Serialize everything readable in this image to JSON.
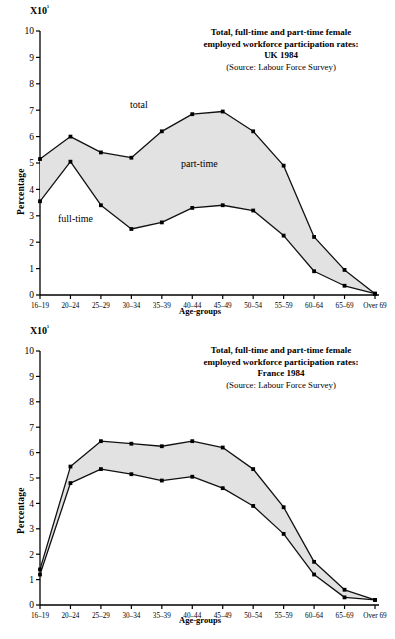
{
  "page": {
    "width": 395,
    "height": 639
  },
  "charts": [
    {
      "id": "uk-1984",
      "exponent_label": "X10",
      "exponent_sup": "¹",
      "title_line1": "Total, full-time and part-time female",
      "title_line2": "employed workforce participation rates:",
      "title_line3": "UK 1984",
      "title_source": "(Source: Labour Force Survey)",
      "ylabel": "Percentage",
      "xlabel": "Age-groups",
      "annotations": [
        {
          "text": "total",
          "x": 130,
          "y": 108
        },
        {
          "text": "part-time",
          "x": 181,
          "y": 167
        },
        {
          "text": "full-time",
          "x": 58,
          "y": 222
        }
      ],
      "yticks": [
        "10",
        "9",
        "8",
        "7",
        "6",
        "5",
        "4",
        "3",
        "2",
        "1",
        "0"
      ],
      "xticks": [
        "16–19",
        "20–24",
        "25–29",
        "30–34",
        "35–39",
        "40–44",
        "45–49",
        "50–54",
        "55–59",
        "60–64",
        "65–69",
        "Over 69"
      ],
      "chart_data": {
        "type": "area",
        "title": "Total, full-time and part-time female employed workforce participation rates: UK 1984",
        "subtitle": "(Source: Labour Force Survey)",
        "xlabel": "Age-groups",
        "ylabel": "Percentage",
        "y_multiplier": "X10¹",
        "ylim": [
          0,
          10
        ],
        "grid": false,
        "legend_position": "inline-annotations",
        "categories": [
          "16–19",
          "20–24",
          "25–29",
          "30–34",
          "35–39",
          "40–44",
          "45–49",
          "50–54",
          "55–59",
          "60–64",
          "65–69",
          "Over 69"
        ],
        "series": [
          {
            "name": "total",
            "values": [
              5.15,
              6.0,
              5.4,
              5.2,
              6.2,
              6.85,
              6.95,
              6.2,
              4.9,
              2.2,
              0.95,
              0.05
            ]
          },
          {
            "name": "full-time",
            "values": [
              3.55,
              5.05,
              3.4,
              2.5,
              2.75,
              3.3,
              3.4,
              3.2,
              2.25,
              0.9,
              0.35,
              0.05
            ]
          }
        ],
        "shaded_band": {
          "name": "part-time",
          "between": [
            "full-time",
            "total"
          ]
        }
      }
    },
    {
      "id": "france-1984",
      "exponent_label": "X10",
      "exponent_sup": "¹",
      "title_line1": "Total, full-time and part-time female",
      "title_line2": "employed workforce participation rates:",
      "title_line3": "France 1984",
      "title_source": "(Source: Labour Force Survey)",
      "ylabel": "Percentage",
      "xlabel": "Age-groups",
      "annotations": [
        {
          "text": "total",
          "x": 232,
          "y": 425
        },
        {
          "text": "part-time",
          "x": 163,
          "y": 452
        },
        {
          "text": "full-time",
          "x": 152,
          "y": 496
        }
      ],
      "yticks": [
        "10",
        "9",
        "8",
        "7",
        "6",
        "5",
        "4",
        "3",
        "2",
        "1",
        "0"
      ],
      "xticks": [
        "16–19",
        "20–24",
        "25–29",
        "30–34",
        "35–39",
        "40–44",
        "45–49",
        "50–54",
        "55–59",
        "60–64",
        "65–69",
        "Over 69"
      ],
      "chart_data": {
        "type": "area",
        "title": "Total, full-time and part-time female employed workforce participation rates: France 1984",
        "subtitle": "(Source: Labour Force Survey)",
        "xlabel": "Age-groups",
        "ylabel": "Percentage",
        "y_multiplier": "X10¹",
        "ylim": [
          0,
          10
        ],
        "grid": false,
        "legend_position": "inline-annotations",
        "categories": [
          "16–19",
          "20–24",
          "25–29",
          "30–34",
          "35–39",
          "40–44",
          "45–49",
          "50–54",
          "55–59",
          "60–64",
          "65–69",
          "Over 69"
        ],
        "series": [
          {
            "name": "total",
            "values": [
              1.4,
              5.45,
              6.45,
              6.35,
              6.25,
              6.45,
              6.2,
              5.35,
              3.85,
              1.7,
              0.6,
              0.2
            ]
          },
          {
            "name": "full-time",
            "values": [
              1.2,
              4.8,
              5.35,
              5.15,
              4.9,
              5.05,
              4.6,
              3.9,
              2.8,
              1.2,
              0.3,
              0.2
            ]
          }
        ],
        "shaded_band": {
          "name": "part-time",
          "between": [
            "full-time",
            "total"
          ]
        }
      }
    }
  ],
  "style": {
    "line_color": "#111111",
    "fill_color": "#e2e2e2",
    "axis_color": "#000000",
    "marker_color": "#000000",
    "background": "#ffffff"
  }
}
